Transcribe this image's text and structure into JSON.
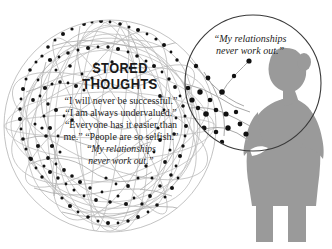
{
  "illustration": {
    "title": "Stored Thoughts",
    "background_color": "#ffffff"
  },
  "sphere": {
    "name": "thought-sphere",
    "line_color": "#b4b4b4",
    "node_color": "#111111",
    "center_x": 110,
    "center_y": 126,
    "radius": 106
  },
  "magnifier": {
    "name": "magnifier-circle",
    "stroke_color": "#3a3a3a",
    "center_x": 253,
    "center_y": 83,
    "radius": 68
  },
  "figure": {
    "name": "woman-silhouette",
    "fill_color": "#9a9a9a"
  },
  "heading": {
    "line1": "STORED",
    "line2": "THOUGHTS"
  },
  "thoughts": {
    "lines": [
      "“I will never be successful.”",
      "“I am always undervalued.”",
      "“Everyone has it easier than",
      "me.” “People are so selfish.”",
      "“My relationships",
      "never work out.”"
    ]
  },
  "bubble": {
    "line1": "“My relationships",
    "line2": "never work out.”"
  }
}
